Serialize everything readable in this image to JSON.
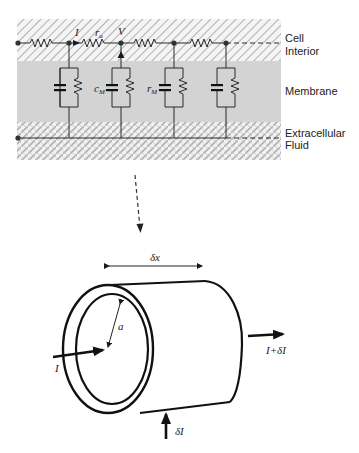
{
  "circuit": {
    "regions": [
      {
        "id": "cell-interior",
        "label_line1": "Cell",
        "label_line2": "Interior",
        "pattern": "diagonal-hatch"
      },
      {
        "id": "membrane",
        "label_line1": "Membrane",
        "color": "#d2d2d2"
      },
      {
        "id": "extracellular",
        "label_line1": "Extracellular",
        "label_line2": "Fluid",
        "pattern": "cross-hatch"
      }
    ],
    "symbols": {
      "current": "I",
      "axial_resistance": "r",
      "axial_resistance_sub": "a",
      "voltage": "V",
      "membrane_capacitance": "c",
      "membrane_capacitance_sub": "M",
      "membrane_resistance": "r",
      "membrane_resistance_sub": "M"
    },
    "node_count": 5,
    "rc_branch_count": 4
  },
  "cylinder": {
    "length_label": "δx",
    "radius_label": "a",
    "input_current": "I",
    "output_current": "I+δI",
    "membrane_current": "δI"
  },
  "colors": {
    "line": "#2a2a2a",
    "hatch": "#b5b5b5",
    "membrane_fill": "#d3d3d3",
    "text": "#222222"
  }
}
